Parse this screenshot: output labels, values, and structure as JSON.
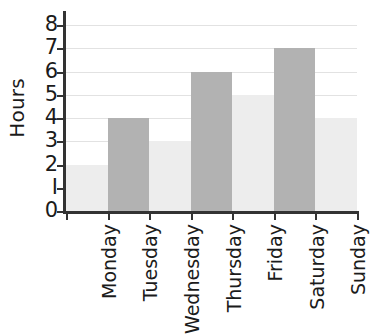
{
  "chart_data": {
    "type": "bar",
    "title": "",
    "subtitle": "",
    "xlabel": "",
    "ylabel": "Hours",
    "categories": [
      "Monday",
      "Tuesday",
      "Wednesday",
      "Thursday",
      "Friday",
      "Saturday",
      "Sunday"
    ],
    "values": [
      2,
      4,
      3,
      6,
      5,
      7,
      4
    ],
    "ylim": [
      0,
      8
    ],
    "ytick_labels": [
      "0",
      "I",
      "2",
      "3",
      "4",
      "5",
      "6",
      "7",
      "8"
    ],
    "ytick_values": [
      0,
      1,
      2,
      3,
      4,
      5,
      6,
      7,
      8
    ],
    "grid": true,
    "grid_axis": "y",
    "legend": false,
    "legend_position": "none",
    "annotations": [],
    "bar_colors": [
      "#ededed",
      "#b2b2b2",
      "#ededed",
      "#b2b2b2",
      "#ededed",
      "#b2b2b2",
      "#ededed"
    ],
    "bar_gap": 0
  },
  "style": {
    "background": "#ffffff",
    "axis_color": "#333333",
    "grid_color": "#e2e2e2",
    "text_color": "#1b1b1b",
    "color_light": "#ededed",
    "color_dark": "#b2b2b2"
  }
}
